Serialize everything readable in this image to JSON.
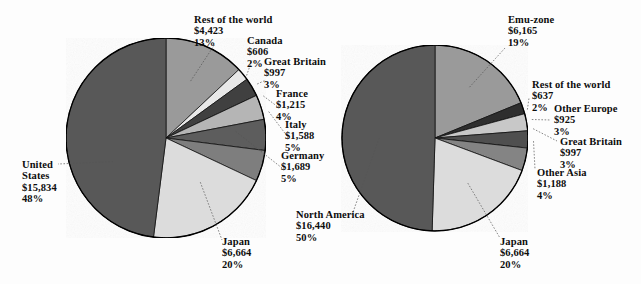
{
  "figure": {
    "background": "#fdfdfd",
    "outline_color": "#000000"
  },
  "chart_data": [
    {
      "type": "pie",
      "id": "left-pie",
      "title": "",
      "center": [
        166,
        138
      ],
      "radius": 100,
      "start_angle_deg": 0,
      "direction": "clockwise",
      "categories": [
        "Rest of the world",
        "Canada",
        "Great Britain",
        "France",
        "Italy",
        "Germany",
        "Japan",
        "United States"
      ],
      "values": [
        4423,
        606,
        997,
        1215,
        1588,
        1689,
        6664,
        15834
      ],
      "percents": [
        13,
        2,
        3,
        4,
        5,
        5,
        20,
        48
      ],
      "value_labels": [
        "$4,423",
        "$606",
        "$997",
        "$1,215",
        "$1,588",
        "$1,689",
        "$6,664",
        "$15,834"
      ],
      "percent_labels": [
        "13%",
        "2%",
        "3%",
        "4%",
        "5%",
        "5%",
        "20%",
        "48%"
      ],
      "colors": [
        "#9a9a9a",
        "#e8e8e8",
        "#3f3f3f",
        "#b5b5b5",
        "#5d5d5d",
        "#7e7e7e",
        "#dcdcdc",
        "#595959"
      ],
      "legend": "none",
      "grid": false
    },
    {
      "type": "pie",
      "id": "right-pie",
      "title": "",
      "center": [
        435,
        138
      ],
      "radius": 93,
      "start_angle_deg": 0,
      "direction": "clockwise",
      "categories": [
        "Emu-zone",
        "Rest of the world",
        "Other Europe",
        "Great Britain",
        "Other Asia",
        "Japan",
        "North America"
      ],
      "values": [
        6165,
        637,
        925,
        997,
        1188,
        6664,
        16440
      ],
      "percents": [
        19,
        2,
        3,
        3,
        4,
        20,
        50
      ],
      "value_labels": [
        "$6,165",
        "$637",
        "$925",
        "$997",
        "$1,188",
        "$6,664",
        "$16,440"
      ],
      "percent_labels": [
        "19%",
        "2%",
        "3%",
        "3%",
        "4%",
        "20%",
        "50%"
      ],
      "colors": [
        "#9a9a9a",
        "#2f2f2f",
        "#c8c8c8",
        "#4f4f4f",
        "#848484",
        "#dcdcdc",
        "#595959"
      ],
      "legend": "none",
      "grid": false
    }
  ],
  "left_labels": [
    {
      "name": "rest-of-the-world",
      "title": "Rest of the world",
      "value": "$4,423",
      "percent": "13%"
    },
    {
      "name": "canada",
      "title": "Canada",
      "value": "$606",
      "percent": "2%"
    },
    {
      "name": "great-britain",
      "title": "Great Britain",
      "value": "$997",
      "percent": "3%"
    },
    {
      "name": "france",
      "title": "France",
      "value": "$1,215",
      "percent": "4%"
    },
    {
      "name": "italy",
      "title": "Italy",
      "value": "$1,588",
      "percent": "5%"
    },
    {
      "name": "germany",
      "title": "Germany",
      "value": "$1,689",
      "percent": "5%"
    },
    {
      "name": "united-states",
      "title": "United States",
      "title_line1": "United",
      "title_line2": "States",
      "value": "$15,834",
      "percent": "48%"
    },
    {
      "name": "japan",
      "title": "Japan",
      "value": "$6,664",
      "percent": "20%"
    }
  ],
  "right_labels": [
    {
      "name": "emu-zone",
      "title": "Emu-zone",
      "value": "$6,165",
      "percent": "19%"
    },
    {
      "name": "rest-of-the-world",
      "title": "Rest of the world",
      "value": "$637",
      "percent": "2%"
    },
    {
      "name": "other-europe",
      "title": "Other Europe",
      "value": "$925",
      "percent": "3%"
    },
    {
      "name": "great-britain",
      "title": "Great Britain",
      "value": "$997",
      "percent": "3%"
    },
    {
      "name": "other-asia",
      "title": "Other Asia",
      "value": "$1,188",
      "percent": "4%"
    },
    {
      "name": "north-america",
      "title": "North America",
      "value": "$16,440",
      "percent": "50%"
    },
    {
      "name": "japan",
      "title": "Japan",
      "value": "$6,664",
      "percent": "20%"
    }
  ]
}
